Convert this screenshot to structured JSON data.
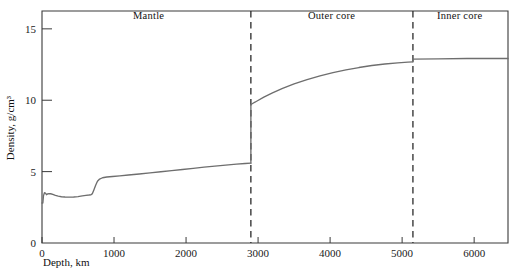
{
  "chart_data": {
    "type": "line",
    "title": "",
    "xlabel": "Depth, km",
    "ylabel": "Density, g/cm³",
    "xlim": [
      0,
      6470
    ],
    "ylim": [
      0,
      16.25
    ],
    "grid": false,
    "legend_position": "none",
    "x_ticks": [
      {
        "value": 0,
        "label": "0"
      },
      {
        "value": 1000,
        "label": "1000"
      },
      {
        "value": 2000,
        "label": "2000"
      },
      {
        "value": 3000,
        "label": "3000"
      },
      {
        "value": 4000,
        "label": "4000"
      },
      {
        "value": 5000,
        "label": "5000"
      },
      {
        "value": 6000,
        "label": "6000"
      }
    ],
    "y_ticks": [
      {
        "value": 0,
        "label": "0"
      },
      {
        "value": 5,
        "label": "5"
      },
      {
        "value": 10,
        "label": "10"
      },
      {
        "value": 15,
        "label": "15"
      }
    ],
    "annotations": [
      {
        "name": "mantle",
        "label": "Mantle",
        "x_center": 1480,
        "y": 15.7
      },
      {
        "name": "outer-core",
        "label": "Outer core",
        "x_center": 4020,
        "y": 15.7
      },
      {
        "name": "inner-core",
        "label": "Inner core",
        "x_center": 5800,
        "y": 15.7
      }
    ],
    "boundaries": [
      {
        "name": "mantle-outer-core-boundary",
        "x": 2900,
        "style": "dashed"
      },
      {
        "name": "outer-inner-core-boundary",
        "x": 5150,
        "style": "dashed"
      }
    ],
    "series": [
      {
        "name": "Mantle density",
        "points": [
          [
            0,
            2.8
          ],
          [
            12,
            2.8
          ],
          [
            20,
            3.3
          ],
          [
            34,
            3.52
          ],
          [
            48,
            3.5
          ],
          [
            62,
            3.38
          ],
          [
            78,
            3.44
          ],
          [
            96,
            3.46
          ],
          [
            120,
            3.45
          ],
          [
            150,
            3.4
          ],
          [
            186,
            3.33
          ],
          [
            225,
            3.28
          ],
          [
            270,
            3.24
          ],
          [
            320,
            3.22
          ],
          [
            380,
            3.21
          ],
          [
            440,
            3.22
          ],
          [
            500,
            3.25
          ],
          [
            560,
            3.3
          ],
          [
            610,
            3.34
          ],
          [
            650,
            3.36
          ],
          [
            680,
            3.38
          ],
          [
            700,
            3.46
          ],
          [
            720,
            3.72
          ],
          [
            745,
            4.04
          ],
          [
            770,
            4.32
          ],
          [
            800,
            4.48
          ],
          [
            840,
            4.57
          ],
          [
            900,
            4.62
          ],
          [
            980,
            4.66
          ],
          [
            1080,
            4.7
          ],
          [
            1200,
            4.76
          ],
          [
            1350,
            4.83
          ],
          [
            1500,
            4.91
          ],
          [
            1650,
            4.99
          ],
          [
            1800,
            5.07
          ],
          [
            1950,
            5.15
          ],
          [
            2100,
            5.23
          ],
          [
            2250,
            5.31
          ],
          [
            2400,
            5.39
          ],
          [
            2550,
            5.46
          ],
          [
            2700,
            5.53
          ],
          [
            2820,
            5.57
          ],
          [
            2900,
            5.59
          ]
        ]
      },
      {
        "name": "Outer core density",
        "points": [
          [
            2900,
            9.7
          ],
          [
            2980,
            9.93
          ],
          [
            3080,
            10.22
          ],
          [
            3200,
            10.52
          ],
          [
            3340,
            10.83
          ],
          [
            3500,
            11.14
          ],
          [
            3680,
            11.44
          ],
          [
            3860,
            11.7
          ],
          [
            4040,
            11.93
          ],
          [
            4220,
            12.12
          ],
          [
            4400,
            12.29
          ],
          [
            4580,
            12.43
          ],
          [
            4760,
            12.54
          ],
          [
            4940,
            12.62
          ],
          [
            5080,
            12.67
          ],
          [
            5150,
            12.69
          ]
        ]
      },
      {
        "name": "Inner core density",
        "points": [
          [
            5150,
            12.88
          ],
          [
            5500,
            12.9
          ],
          [
            5900,
            12.92
          ],
          [
            6470,
            12.92
          ]
        ]
      }
    ]
  }
}
